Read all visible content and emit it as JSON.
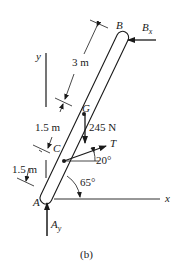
{
  "figure": {
    "caption": "(b)",
    "points": {
      "A": "A",
      "B": "B",
      "C": "C",
      "G": "G"
    },
    "axes": {
      "x_label": "x",
      "y_label": "y"
    },
    "dimensions": {
      "upper": "3 m",
      "middle": "1.5 m",
      "lower": "1.5 m"
    },
    "forces": {
      "weight": "245 N",
      "tension": "T",
      "reaction_b": "B",
      "reaction_b_sub": "x",
      "reaction_a": "A",
      "reaction_a_sub": "y"
    },
    "angles": {
      "rod_angle": "65°",
      "tension_angle": "20°"
    },
    "colors": {
      "ink": "#1a1a1a",
      "background": "#ffffff"
    }
  }
}
